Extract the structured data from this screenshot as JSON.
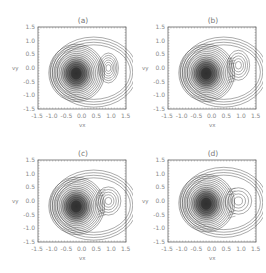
{
  "figure": {
    "panels": [
      {
        "id": "a",
        "title": "(a)",
        "xlabel": "vx",
        "ylabel": "vy"
      },
      {
        "id": "b",
        "title": "(b)",
        "xlabel": "vx",
        "ylabel": "vy"
      },
      {
        "id": "c",
        "title": "(c)",
        "xlabel": "vx",
        "ylabel": "vy"
      },
      {
        "id": "d",
        "title": "(d)",
        "xlabel": "vx",
        "ylabel": "vy"
      }
    ],
    "xticks": [
      "-1.5",
      "-1.0",
      "-0.5",
      "0.0",
      "0.5",
      "1.0",
      "1.5"
    ],
    "yticks": [
      "1.5",
      "1.0",
      "0.5",
      "0.0",
      "-0.5",
      "-1.0",
      "-1.5"
    ]
  },
  "chart_data": [
    {
      "type": "contour",
      "title": "(a)",
      "xlabel": "v_x",
      "ylabel": "v_y",
      "xlim": [
        -1.5,
        1.5
      ],
      "ylim": [
        -1.5,
        1.5
      ],
      "xticks": [
        -1.5,
        -1.0,
        -0.5,
        0.0,
        0.5,
        1.0,
        1.5
      ],
      "yticks": [
        -1.5,
        -1.0,
        -0.5,
        0.0,
        0.5,
        1.0,
        1.5
      ],
      "peaks": [
        {
          "label": "core",
          "center": [
            -0.2,
            -0.2
          ],
          "relative_amplitude": "dominant"
        },
        {
          "label": "beam",
          "center": [
            0.9,
            0.0
          ],
          "relative_amplitude": "secondary, distinct"
        }
      ]
    },
    {
      "type": "contour",
      "title": "(b)",
      "xlabel": "v_x",
      "ylabel": "v_y",
      "xlim": [
        -1.5,
        1.5
      ],
      "ylim": [
        -1.5,
        1.5
      ],
      "xticks": [
        -1.5,
        -1.0,
        -0.5,
        0.0,
        0.5,
        1.0,
        1.5
      ],
      "yticks": [
        -1.5,
        -1.0,
        -0.5,
        0.0,
        0.5,
        1.0,
        1.5
      ],
      "peaks": [
        {
          "label": "core",
          "center": [
            -0.2,
            -0.2
          ],
          "relative_amplitude": "dominant"
        },
        {
          "label": "beam",
          "center": [
            0.9,
            0.1
          ],
          "relative_amplitude": "secondary, broadened"
        }
      ]
    },
    {
      "type": "contour",
      "title": "(c)",
      "xlabel": "v_x",
      "ylabel": "v_y",
      "xlim": [
        -1.5,
        1.5
      ],
      "ylim": [
        -1.5,
        1.5
      ],
      "xticks": [
        -1.5,
        -1.0,
        -0.5,
        0.0,
        0.5,
        1.0,
        1.5
      ],
      "yticks": [
        -1.5,
        -1.0,
        -0.5,
        0.0,
        0.5,
        1.0,
        1.5
      ],
      "peaks": [
        {
          "label": "core",
          "center": [
            -0.2,
            -0.2
          ],
          "relative_amplitude": "dominant"
        },
        {
          "label": "beam",
          "center": [
            0.9,
            0.0
          ],
          "relative_amplitude": "weak, merging"
        }
      ]
    },
    {
      "type": "contour",
      "title": "(d)",
      "xlabel": "v_x",
      "ylabel": "v_y",
      "xlim": [
        -1.5,
        1.5
      ],
      "ylim": [
        -1.5,
        1.5
      ],
      "xticks": [
        -1.5,
        -1.0,
        -0.5,
        0.0,
        0.5,
        1.0,
        1.5
      ],
      "yticks": [
        -1.5,
        -1.0,
        -0.5,
        0.0,
        0.5,
        1.0,
        1.5
      ],
      "peaks": [
        {
          "label": "core",
          "center": [
            -0.2,
            -0.1
          ],
          "relative_amplitude": "dominant"
        },
        {
          "label": "beam",
          "center": [
            0.9,
            0.0
          ],
          "relative_amplitude": "weak plateau"
        }
      ]
    }
  ]
}
